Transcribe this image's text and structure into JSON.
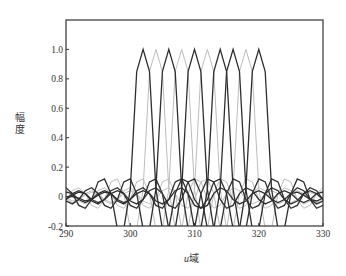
{
  "chart_data": {
    "type": "line",
    "title": "",
    "xlabel": "u域",
    "xlabel_parts": {
      "var": "u",
      "suffix": "域"
    },
    "ylabel": "幅度",
    "xlim": [
      290,
      330
    ],
    "ylim": [
      -0.2,
      1.2
    ],
    "xticks": [
      290,
      300,
      310,
      320,
      330
    ],
    "xtick_labels": [
      "290",
      "300",
      "310",
      "320",
      "330"
    ],
    "yticks": [
      -0.2,
      0,
      0.2,
      0.4,
      0.6,
      0.8,
      1.0
    ],
    "ytick_labels": [
      "-0.2",
      "0",
      "0.2",
      "0.4",
      "0.6",
      "0.8",
      "1.0"
    ],
    "grid": false,
    "legend": null,
    "kernel_description": "sinc-like main lobe sampled at integer u; values by offset from peak",
    "kernel_offsets": [
      0,
      1,
      2,
      3,
      4,
      5,
      6,
      7,
      8,
      9,
      10,
      11,
      12,
      13,
      14,
      15,
      16,
      17,
      18,
      19,
      20,
      21,
      22,
      23,
      24,
      25,
      26,
      27,
      28
    ],
    "kernel_values": [
      1.0,
      0.85,
      0.05,
      -0.22,
      -0.22,
      0.02,
      0.12,
      0.1,
      -0.02,
      -0.08,
      -0.06,
      0.02,
      0.06,
      0.04,
      -0.02,
      -0.05,
      -0.03,
      0.02,
      0.04,
      0.02,
      -0.02,
      -0.04,
      -0.02,
      0.02,
      0.03,
      0.01,
      -0.02,
      -0.03,
      -0.01
    ],
    "series": [
      {
        "name": "peak 302",
        "peak_u": 302,
        "color": "#2e2e2e"
      },
      {
        "name": "peak 304",
        "peak_u": 304,
        "color": "#bdbdbd"
      },
      {
        "name": "peak 306",
        "peak_u": 306,
        "color": "#2e2e2e"
      },
      {
        "name": "peak 308",
        "peak_u": 308,
        "color": "#bdbdbd"
      },
      {
        "name": "peak 310",
        "peak_u": 310,
        "color": "#2e2e2e"
      },
      {
        "name": "peak 312",
        "peak_u": 312,
        "color": "#bdbdbd"
      },
      {
        "name": "peak 314",
        "peak_u": 314,
        "color": "#2e2e2e"
      },
      {
        "name": "peak 316",
        "peak_u": 316,
        "color": "#2e2e2e"
      },
      {
        "name": "peak 318",
        "peak_u": 318,
        "color": "#bdbdbd"
      },
      {
        "name": "peak 320",
        "peak_u": 320,
        "color": "#2e2e2e"
      }
    ]
  },
  "plot_area": {
    "left": 66,
    "top": 20,
    "right": 323,
    "bottom": 226
  }
}
